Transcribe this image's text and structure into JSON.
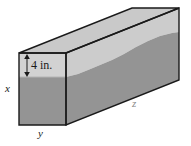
{
  "figure": {
    "type": "rectangular-prism-liquid-diagram",
    "caption": "",
    "labels": {
      "depth_dimension": "4 in.",
      "height_axis": "x",
      "width_axis": "y",
      "length_axis": "z"
    },
    "colors": {
      "outline": "#1a1a1a",
      "liquid_fill": "#949494",
      "air_fill": "#cccccc",
      "top_face": "#c9c9c9",
      "background": "#ffffff",
      "label_text": "#1a1a1a",
      "faint_label_text": "#8a8a8a"
    },
    "geometry": {
      "front_face": {
        "top_left": [
          19,
          53
        ],
        "top_right": [
          66,
          53
        ],
        "bottom_right": [
          66,
          125
        ],
        "bottom_left": [
          19,
          125
        ]
      },
      "depth_offset": [
        113,
        -45
      ],
      "back_top_right": [
        179,
        8
      ],
      "back_bottom_right": [
        179,
        80
      ],
      "front_waterline_y": 77,
      "back_waterline_y": 32
    },
    "annotations": {
      "arrow_name": "double-headed-vertical-arrow",
      "arrow_x": 27,
      "arrow_top_y": 55,
      "arrow_bottom_y": 76
    }
  }
}
